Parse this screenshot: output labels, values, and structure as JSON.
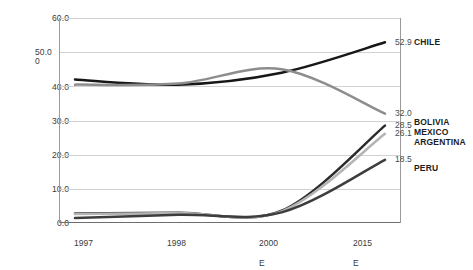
{
  "chart_data": {
    "type": "line",
    "title": "",
    "xlabel": "",
    "ylabel": "",
    "x": [
      "1997",
      "1998",
      "2000 E",
      "2015 E"
    ],
    "xtick_labels": [
      {
        "line1": "1997",
        "line2": ""
      },
      {
        "line1": "1998",
        "line2": ""
      },
      {
        "line1": "2000",
        "line2": "E"
      },
      {
        "line1": "2015",
        "line2": "E"
      }
    ],
    "ylim": [
      0.0,
      60.0
    ],
    "yticks": [
      "0.0",
      "10.0",
      "20.0",
      "30.0",
      "40.0",
      "50.0",
      "60.0"
    ],
    "ytick_50_wrapped": {
      "line1": "50.0",
      "line2": "0"
    },
    "grid": true,
    "legend_position": "right",
    "series": [
      {
        "name": "CHILE",
        "color": "#171717",
        "values": [
          42.0,
          40.5,
          44.0,
          52.9
        ],
        "end_label": "52.9"
      },
      {
        "name": "BOLIVIA",
        "color": "#8d8d8d",
        "values": [
          40.5,
          40.8,
          45.0,
          32.0
        ],
        "end_label": "32.0"
      },
      {
        "name": "MEXICO",
        "color": "#2b2b2b",
        "values": [
          2.8,
          3.0,
          3.6,
          28.5
        ],
        "end_label": "28.5"
      },
      {
        "name": "ARGENTINA",
        "color": "#b4b4b4",
        "values": [
          2.6,
          2.9,
          3.4,
          26.1
        ],
        "end_label": "26.1"
      },
      {
        "name": "PERU",
        "color": "#3d3d3d",
        "values": [
          1.5,
          2.4,
          3.1,
          18.5
        ],
        "end_label": "18.5"
      }
    ],
    "value_labels": [
      "52.9",
      "32.0",
      "28.5",
      "26.1",
      "18.5"
    ],
    "legend_groups": [
      {
        "lines": [
          "CHILE"
        ]
      },
      {
        "lines": [
          "BOLIVIA",
          "MEXICO"
        ]
      },
      {
        "lines": [
          "ARGENTINA"
        ]
      },
      {
        "lines": [
          "PERU"
        ]
      }
    ]
  },
  "yticks": {
    "t60": "60.0",
    "t50a": "50.0",
    "t50b": "0",
    "t40": "40.0",
    "t30": "30.0",
    "t20": "20.0",
    "t10": "10.0",
    "t0": "0.0"
  },
  "xticks": {
    "x1_top": "1997",
    "x1_bot": "",
    "x2_top": "1998",
    "x2_bot": "",
    "x3_top": "2000",
    "x3_bot": "E",
    "x4_top": "2015",
    "x4_bot": "E"
  },
  "labels": {
    "v_chile": "52.9",
    "v_bolivia": "32.0",
    "v_mexico": "28.5",
    "v_argentina": "26.1",
    "v_peru": "18.5"
  },
  "names": {
    "chile": "CHILE",
    "bolivia": "BOLIVIA",
    "mexico": "MEXICO",
    "argentina": "ARGENTINA",
    "peru": "PERU"
  },
  "footer": {
    "ghost_text": ""
  }
}
